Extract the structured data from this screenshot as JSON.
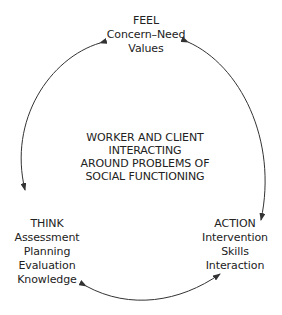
{
  "diagram": {
    "type": "cycle",
    "nodes": {
      "feel": {
        "title": "FEEL",
        "lines": [
          "Concern–Need",
          "Values"
        ]
      },
      "think": {
        "title": "THINK",
        "lines": [
          "Assessment",
          "Planning",
          "Evaluation",
          "Knowledge"
        ]
      },
      "action": {
        "title": "ACTION",
        "lines": [
          "Intervention",
          "Skills",
          "Interaction"
        ]
      }
    },
    "center": {
      "lines": [
        "WORKER AND CLIENT",
        "INTERACTING",
        "AROUND PROBLEMS OF",
        "SOCIAL FUNCTIONING"
      ]
    },
    "edges": [
      {
        "from": "feel",
        "to": "think",
        "style": "double-arrow curved"
      },
      {
        "from": "feel",
        "to": "action",
        "style": "double-arrow curved"
      },
      {
        "from": "think",
        "to": "action",
        "style": "double-arrow curved"
      }
    ],
    "colors": {
      "line": "#333333",
      "text": "#222222",
      "background": "#ffffff"
    }
  }
}
